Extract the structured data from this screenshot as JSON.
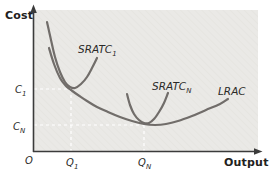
{
  "figure": {
    "cost_axis_label": "Cost",
    "output_axis_label": "Output",
    "origin_label": "O",
    "labels": {
      "sratc1": {
        "base": "SRATC",
        "sub": "1"
      },
      "sratcn": {
        "base": "SRATC",
        "sub": "N"
      },
      "lrac": {
        "base": "LRAC",
        "sub": ""
      },
      "c1": {
        "base": "C",
        "sub": "1"
      },
      "cn": {
        "base": "C",
        "sub": "N"
      },
      "q1": {
        "base": "Q",
        "sub": "1"
      },
      "qn": {
        "base": "Q",
        "sub": "N"
      }
    }
  },
  "chart_data": {
    "type": "line",
    "title": "",
    "xlabel": "Output",
    "ylabel": "Cost",
    "x_ticks": [
      "O",
      "Q1",
      "QN"
    ],
    "y_ticks": [
      "C1",
      "CN"
    ],
    "legend": [
      "SRATC1",
      "SRATCN",
      "LRAC"
    ],
    "key_points": [
      {
        "label": "SRATC1 tangency",
        "x": "Q1",
        "y": "C1"
      },
      {
        "label": "SRATCN tangency at LRAC minimum",
        "x": "QN",
        "y": "CN"
      }
    ],
    "curves": [
      {
        "id": "sratc1",
        "name": "SRATC1",
        "points": [
          [
            47,
            22
          ],
          [
            51,
            40
          ],
          [
            55,
            57
          ],
          [
            60,
            72
          ],
          [
            65,
            82
          ],
          [
            70,
            87
          ],
          [
            75,
            88
          ],
          [
            81,
            84
          ],
          [
            87,
            77
          ],
          [
            92,
            68
          ],
          [
            97,
            58
          ]
        ]
      },
      {
        "id": "sratcn",
        "name": "SRATCN",
        "points": [
          [
            127,
            94
          ],
          [
            130,
            105
          ],
          [
            134,
            114
          ],
          [
            139,
            120
          ],
          [
            144,
            123
          ],
          [
            149,
            123
          ],
          [
            154,
            119
          ],
          [
            159,
            112
          ],
          [
            164,
            103
          ],
          [
            168,
            93
          ]
        ]
      },
      {
        "id": "lrac",
        "name": "LRAC",
        "points": [
          [
            49,
            48
          ],
          [
            54,
            64
          ],
          [
            60,
            78
          ],
          [
            66,
            86
          ],
          [
            71,
            90
          ],
          [
            78,
            95
          ],
          [
            87,
            101
          ],
          [
            97,
            107
          ],
          [
            108,
            112
          ],
          [
            120,
            117
          ],
          [
            132,
            121
          ],
          [
            144,
            124
          ],
          [
            155,
            125
          ],
          [
            166,
            124
          ],
          [
            178,
            121
          ],
          [
            192,
            116
          ],
          [
            206,
            110
          ],
          [
            220,
            104
          ],
          [
            228,
            99
          ]
        ]
      }
    ],
    "guides": {
      "c1-horizontal": {
        "x1": 34,
        "y1": 89,
        "x2": 71,
        "y2": 89
      },
      "q1-vertical": {
        "x1": 71,
        "y1": 89,
        "x2": 71,
        "y2": 151
      },
      "cn-horizontal": {
        "x1": 34,
        "y1": 125,
        "x2": 144,
        "y2": 125
      },
      "qn-vertical": {
        "x1": 144,
        "y1": 125,
        "x2": 144,
        "y2": 151
      }
    },
    "colors": {
      "curve": "#716d6a",
      "axis": "#3b3b3b",
      "guide": "#ffffff",
      "plot_bg": "#eae9e6",
      "plot_hatch": "#e2e1dd",
      "page_bg": "#ffffff"
    }
  }
}
